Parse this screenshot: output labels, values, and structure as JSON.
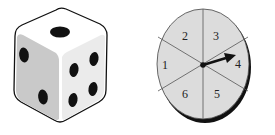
{
  "die": {
    "top_face_pips": 1,
    "left_face_pips": 2,
    "right_face_pips": 4
  },
  "spinner": {
    "sections": [
      "1",
      "2",
      "3",
      "4",
      "5",
      "6"
    ],
    "label_1": "1",
    "label_2": "2",
    "label_3": "3",
    "label_4": "4",
    "label_5": "5",
    "label_6": "6",
    "pointer_at": "4",
    "fill_color": "#dcdcdc"
  }
}
